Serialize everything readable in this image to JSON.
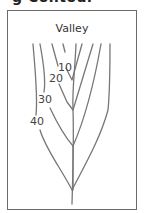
{
  "figure": {
    "heading_fragment": "g   Contour",
    "title": "Valley",
    "contour_labels": [
      {
        "text": "10",
        "x": 66,
        "y": 69
      },
      {
        "text": "20",
        "x": 56,
        "y": 80
      },
      {
        "text": "30",
        "x": 45,
        "y": 102
      },
      {
        "text": "40",
        "x": 37,
        "y": 124
      }
    ],
    "line_color": "#777777",
    "frame_color": "#6b6b6b"
  }
}
